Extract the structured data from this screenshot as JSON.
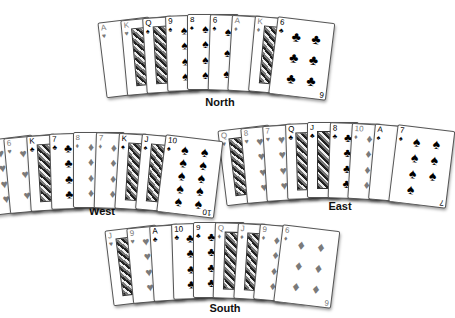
{
  "hands": [
    {
      "seat": "North",
      "cards": [
        {
          "rank": "A",
          "suit": "♥",
          "color": "red"
        },
        {
          "rank": "K",
          "suit": "♥",
          "color": "red"
        },
        {
          "rank": "Q",
          "suit": "♠",
          "color": "black"
        },
        {
          "rank": "9",
          "suit": "♠",
          "color": "black"
        },
        {
          "rank": "8",
          "suit": "♠",
          "color": "black"
        },
        {
          "rank": "6",
          "suit": "♠",
          "color": "black"
        },
        {
          "rank": "A",
          "suit": "♦",
          "color": "red"
        },
        {
          "rank": "K",
          "suit": "♦",
          "color": "red"
        },
        {
          "rank": "6",
          "suit": "♣",
          "color": "black"
        }
      ]
    },
    {
      "seat": "West",
      "cards": [
        {
          "rank": "10",
          "suit": "♥",
          "color": "red"
        },
        {
          "rank": "6",
          "suit": "♥",
          "color": "red"
        },
        {
          "rank": "K",
          "suit": "♣",
          "color": "black"
        },
        {
          "rank": "7",
          "suit": "♣",
          "color": "black"
        },
        {
          "rank": "8",
          "suit": "♦",
          "color": "red"
        },
        {
          "rank": "7",
          "suit": "♦",
          "color": "red"
        },
        {
          "rank": "K",
          "suit": "♠",
          "color": "black"
        },
        {
          "rank": "J",
          "suit": "♠",
          "color": "black"
        },
        {
          "rank": "10",
          "suit": "♠",
          "color": "black"
        }
      ]
    },
    {
      "seat": "East",
      "cards": [
        {
          "rank": "Q",
          "suit": "♥",
          "color": "red"
        },
        {
          "rank": "8",
          "suit": "♥",
          "color": "red"
        },
        {
          "rank": "7",
          "suit": "♥",
          "color": "red"
        },
        {
          "rank": "Q",
          "suit": "♣",
          "color": "black"
        },
        {
          "rank": "J",
          "suit": "♣",
          "color": "black"
        },
        {
          "rank": "8",
          "suit": "♣",
          "color": "black"
        },
        {
          "rank": "10",
          "suit": "♦",
          "color": "red"
        },
        {
          "rank": "A",
          "suit": "♠",
          "color": "black"
        },
        {
          "rank": "7",
          "suit": "♠",
          "color": "black"
        }
      ]
    },
    {
      "seat": "South",
      "cards": [
        {
          "rank": "J",
          "suit": "♥",
          "color": "red"
        },
        {
          "rank": "9",
          "suit": "♥",
          "color": "red"
        },
        {
          "rank": "A",
          "suit": "♣",
          "color": "black"
        },
        {
          "rank": "10",
          "suit": "♣",
          "color": "black"
        },
        {
          "rank": "9",
          "suit": "♣",
          "color": "black"
        },
        {
          "rank": "Q",
          "suit": "♦",
          "color": "red"
        },
        {
          "rank": "J",
          "suit": "♦",
          "color": "red"
        },
        {
          "rank": "9",
          "suit": "♦",
          "color": "red"
        },
        {
          "rank": "6",
          "suit": "♦",
          "color": "red"
        }
      ]
    }
  ],
  "labels": {
    "north": "North",
    "west": "West",
    "east": "East",
    "south": "South"
  },
  "colors": {
    "red_suit_rendered": "#7a7a7a",
    "black_suit": "#000000",
    "background": "#ffffff"
  }
}
